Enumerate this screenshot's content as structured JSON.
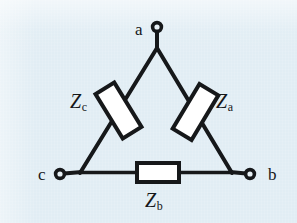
{
  "figure": {
    "background_color": "#e1edf4",
    "ink_color": "#16181a",
    "component_fill_color": "#ffffff"
  },
  "nodes": [
    {
      "id": "a",
      "label": "a",
      "terminal": "open-circle",
      "position": {
        "x": 157,
        "y": 27
      }
    },
    {
      "id": "b",
      "label": "b",
      "terminal": "open-circle",
      "position": {
        "x": 250,
        "y": 174
      }
    },
    {
      "id": "c",
      "label": "c",
      "terminal": "open-circle",
      "position": {
        "x": 60,
        "y": 174
      }
    }
  ],
  "components": [
    {
      "id": "Za",
      "label": "Z",
      "subscript": "a",
      "type": "impedance",
      "between": [
        "a",
        "b"
      ]
    },
    {
      "id": "Zb",
      "label": "Z",
      "subscript": "b",
      "type": "impedance",
      "between": [
        "c",
        "b"
      ]
    },
    {
      "id": "Zc",
      "label": "Z",
      "subscript": "c",
      "type": "impedance",
      "between": [
        "a",
        "c"
      ]
    }
  ]
}
